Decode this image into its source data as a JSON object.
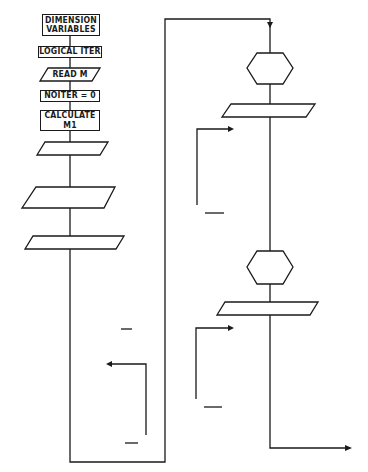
{
  "left_column": {
    "nodes": [
      {
        "id": "dimension",
        "shape": "rect",
        "label": "DIMENSION\nVARIABLES"
      },
      {
        "id": "logical",
        "shape": "rect",
        "label": "LOGICAL  ITER"
      },
      {
        "id": "read_m",
        "shape": "parallelogram",
        "label": "READ  M"
      },
      {
        "id": "noiter0",
        "shape": "rect",
        "label": "NOITER = 0"
      },
      {
        "id": "calc_m1",
        "shape": "rect",
        "label": "CALCULATE\nM1"
      },
      {
        "id": "init_bulk",
        "shape": "rect",
        "label": "INITIALIZE  BULK\nVARIABLES"
      },
      {
        "id": "read_input",
        "shape": "parallelogram",
        "label": "READ  INPUT"
      },
      {
        "id": "calc_const",
        "shape": "rect",
        "label": "CALCULATE\nCONSTANTS"
      },
      {
        "id": "write_title_nl",
        "shape": "parallelogram",
        "label": "WRITE  TITLE,\nNAMELIST"
      },
      {
        "id": "calc_z",
        "shape": "rect",
        "label": "CALCULATE  Z,ZZ"
      },
      {
        "id": "write_title_z",
        "shape": "parallelogram",
        "label": "WRITE  TITLE,  Z(I)"
      },
      {
        "id": "calc_const_c",
        "shape": "rect",
        "label": "CALCULATE\nCONSTANTS\nC11, C13, C21, C23"
      },
      {
        "id": "init_surface",
        "shape": "rect",
        "label": "INITIALIZE\nSURFACE\nVARIABLES"
      },
      {
        "id": "noiter_inc",
        "shape": "rect",
        "label": "NOITER = NOITER + 1"
      },
      {
        "id": "iter_false",
        "shape": "rect",
        "label": "ITER =  *FALSE*"
      },
      {
        "id": "do10",
        "shape": "rect",
        "label": "DO 10  I=2, M"
      },
      {
        "id": "calc_ts_1",
        "shape": "rect",
        "label": "CALCULATE  TS(I)  BY\nNEWTON-RAPHSON\nITERATION"
      },
      {
        "id": "calc_other_1",
        "shape": "rect",
        "label": "CALCULATE  OTHER\nPARAMETERS  FROM\nTS(I)"
      },
      {
        "id": "calc_tridag_1",
        "shape": "rect",
        "label": "CALCULATE  TRIDAG\nCOEFFICIENTS"
      }
    ],
    "connectors": [
      {
        "id": "c20",
        "label": "20"
      },
      {
        "id": "c10",
        "label": "10"
      }
    ]
  },
  "right_column": {
    "nodes": [
      {
        "id": "set_bc",
        "shape": "rect",
        "label": "SET  BOUNDARY\nCONDITIONS"
      },
      {
        "id": "call_tridag_1",
        "shape": "hexagon",
        "label": "CALL\nTRI DAG"
      },
      {
        "id": "write_cr",
        "shape": "parallelogram",
        "label": "WRITE  CR(I)"
      },
      {
        "id": "do12",
        "shape": "rect",
        "label": "DO 12  I=2, M"
      },
      {
        "id": "calc_ts_2",
        "shape": "rect",
        "label": "CALCULATE  TS(I) BY\nNEWTON - RAPHSON\nITERATION"
      },
      {
        "id": "calc_other_2",
        "shape": "rect",
        "label": "CALCULATE  OTHER\nPARAMETERS FROM TS(I)"
      },
      {
        "id": "calc_tridag_2",
        "shape": "rect",
        "label": "CALCULATE  TRIDAG\nCOEFFICIENTS"
      },
      {
        "id": "set_bv_1",
        "shape": "rect",
        "label": "SET  BOUNDARY  VALUES"
      },
      {
        "id": "call_tridag_2",
        "shape": "hexagon",
        "label": "CALL\nTRIDAG"
      },
      {
        "id": "write_crn",
        "shape": "parallelogram",
        "label": "WRITE  CRN(I)"
      },
      {
        "id": "do14",
        "shape": "rect",
        "label": "DO 14  I=2, M"
      },
      {
        "id": "calc_ts_3",
        "shape": "rect",
        "label": "CALCULATE  TS(I)  BY\nNEWTON-RAPHSON\nITERATION"
      },
      {
        "id": "calc_other_3",
        "shape": "rect",
        "label": "CALCULATE  OTHER\nPARAMETERS FROM TS(I)"
      },
      {
        "id": "calc_tridag_3",
        "shape": "rect",
        "label": "CALCULATE  TRIDAG\nCOEFFICIENTS"
      },
      {
        "id": "set_bv_2",
        "shape": "rect",
        "label": "SET  BOUNDARY  VALUES"
      }
    ],
    "connectors": [
      {
        "id": "c12",
        "label": "12"
      },
      {
        "id": "c14",
        "label": "14"
      }
    ]
  },
  "colors": {
    "ink": "#1a1a1a",
    "paper": "#ffffff"
  }
}
